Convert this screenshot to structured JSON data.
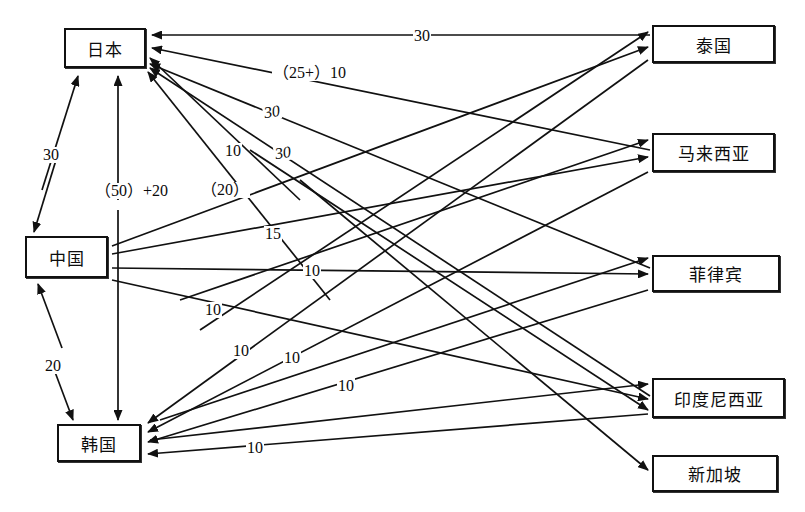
{
  "diagram": {
    "type": "network-flow-diagram",
    "title": "",
    "background_color": "#ffffff",
    "line_color": "#111111",
    "source_nodes": [
      {
        "id": "japan",
        "label": "日本",
        "x": 64,
        "y": 28,
        "w": 82,
        "h": 40
      },
      {
        "id": "china",
        "label": "中国",
        "x": 25,
        "y": 236,
        "w": 83,
        "h": 42
      },
      {
        "id": "korea",
        "label": "韩国",
        "x": 57,
        "y": 424,
        "w": 84,
        "h": 38
      }
    ],
    "target_nodes": [
      {
        "id": "thailand",
        "label": "泰国",
        "x": 652,
        "y": 25,
        "w": 123,
        "h": 38
      },
      {
        "id": "malaysia",
        "label": "马来西亚",
        "x": 652,
        "y": 133,
        "w": 123,
        "h": 39
      },
      {
        "id": "philippines",
        "label": "菲律宾",
        "x": 652,
        "y": 255,
        "w": 128,
        "h": 37
      },
      {
        "id": "indonesia",
        "label": "印度尼西亚",
        "x": 652,
        "y": 378,
        "w": 133,
        "h": 40
      },
      {
        "id": "singapore",
        "label": "新加坡",
        "x": 652,
        "y": 455,
        "w": 126,
        "h": 37
      }
    ],
    "edge_labels": [
      {
        "id": "lbl-top-30",
        "text": "30",
        "x": 413,
        "y": 28,
        "style": "plain"
      },
      {
        "id": "lbl-25plus-10",
        "text": "（25+）10",
        "x": 272,
        "y": 65,
        "style": "plain"
      },
      {
        "id": "lbl-30-a",
        "text": "30",
        "x": 263,
        "y": 104,
        "style": "italic-rot"
      },
      {
        "id": "lbl-10-a",
        "text": "10",
        "x": 224,
        "y": 143,
        "style": "plain"
      },
      {
        "id": "lbl-30-b",
        "text": "30",
        "x": 274,
        "y": 145,
        "style": "italic-rot"
      },
      {
        "id": "lbl-30-left",
        "text": "30",
        "x": 42,
        "y": 147,
        "style": "plain"
      },
      {
        "id": "lbl-50plus20",
        "text": "（50）+20",
        "x": 94,
        "y": 183,
        "style": "plain"
      },
      {
        "id": "lbl-20-paren",
        "text": "（20）",
        "x": 200,
        "y": 182,
        "style": "plain"
      },
      {
        "id": "lbl-15",
        "text": "15",
        "x": 264,
        "y": 226,
        "style": "plain"
      },
      {
        "id": "lbl-10-b",
        "text": "10",
        "x": 303,
        "y": 263,
        "style": "plain"
      },
      {
        "id": "lbl-10-c",
        "text": "10",
        "x": 204,
        "y": 302,
        "style": "plain"
      },
      {
        "id": "lbl-20-left",
        "text": "20",
        "x": 44,
        "y": 358,
        "style": "plain"
      },
      {
        "id": "lbl-10-d",
        "text": "10",
        "x": 232,
        "y": 343,
        "style": "plain"
      },
      {
        "id": "lbl-10-e",
        "text": "10",
        "x": 283,
        "y": 350,
        "style": "plain"
      },
      {
        "id": "lbl-10-f",
        "text": "10",
        "x": 337,
        "y": 378,
        "style": "plain"
      },
      {
        "id": "lbl-10-g",
        "text": "10",
        "x": 246,
        "y": 440,
        "style": "plain"
      }
    ],
    "edges": [
      {
        "id": "e-thailand-japan",
        "from": "thailand",
        "to": "japan",
        "label": "30",
        "x1": 652,
        "y1": 36,
        "x2": 150,
        "y2": 36
      },
      {
        "id": "e-malaysia-japan",
        "from": "malaysia",
        "to": "japan",
        "label": "（25+）10",
        "x1": 650,
        "y1": 148,
        "x2": 150,
        "y2": 47
      },
      {
        "id": "e-philippines-japan",
        "from": "philippines",
        "to": "japan",
        "label": "30",
        "x1": 650,
        "y1": 262,
        "x2": 150,
        "y2": 62
      },
      {
        "id": "e-indonesia-japan",
        "from": "indonesia",
        "to": "japan",
        "label": "10",
        "x1": 650,
        "y1": 392,
        "x2": 150,
        "y2": 66
      },
      {
        "id": "e-singapore-japan",
        "from": "singapore",
        "to": "japan",
        "label": "30",
        "x1": 560,
        "y1": 330,
        "x2": 150,
        "y2": 70
      },
      {
        "id": "e-china-thailand",
        "from": "china",
        "to": "thailand",
        "label": "（20）",
        "x1": 110,
        "y1": 244,
        "x2": 650,
        "y2": 48
      },
      {
        "id": "e-china-malaysia",
        "from": "china",
        "to": "malaysia",
        "label": "15",
        "x1": 110,
        "y1": 252,
        "x2": 650,
        "y2": 158
      },
      {
        "id": "e-china-philippines",
        "from": "china",
        "to": "philippines",
        "label": "10",
        "x1": 110,
        "y1": 267,
        "x2": 650,
        "y2": 274
      },
      {
        "id": "e-china-indonesia",
        "from": "china",
        "to": "indonesia",
        "label": "10",
        "x1": 110,
        "y1": 278,
        "x2": 650,
        "y2": 398
      },
      {
        "id": "e-japan-china",
        "from": "japan",
        "to": "china",
        "label": "30",
        "bidirectional": true
      },
      {
        "id": "e-japan-korea",
        "from": "japan",
        "to": "korea",
        "label": "（50）+20",
        "bidirectional": true
      },
      {
        "id": "e-china-korea",
        "from": "china",
        "to": "korea",
        "label": "20",
        "bidirectional": true
      },
      {
        "id": "e-thailand-korea",
        "from": "thailand",
        "to": "korea",
        "label": "10",
        "x1": 650,
        "y1": 58,
        "x2": 146,
        "y2": 424
      },
      {
        "id": "e-malaysia-korea",
        "from": "malaysia",
        "to": "korea",
        "label": "10",
        "x1": 650,
        "y1": 168,
        "x2": 146,
        "y2": 432
      },
      {
        "id": "e-philippines-korea",
        "from": "philippines",
        "to": "korea",
        "label": "10",
        "x1": 650,
        "y1": 288,
        "x2": 146,
        "y2": 441
      },
      {
        "id": "e-indonesia-korea",
        "from": "indonesia",
        "to": "korea",
        "label": "10",
        "x1": 650,
        "y1": 410,
        "x2": 146,
        "y2": 453
      }
    ]
  }
}
